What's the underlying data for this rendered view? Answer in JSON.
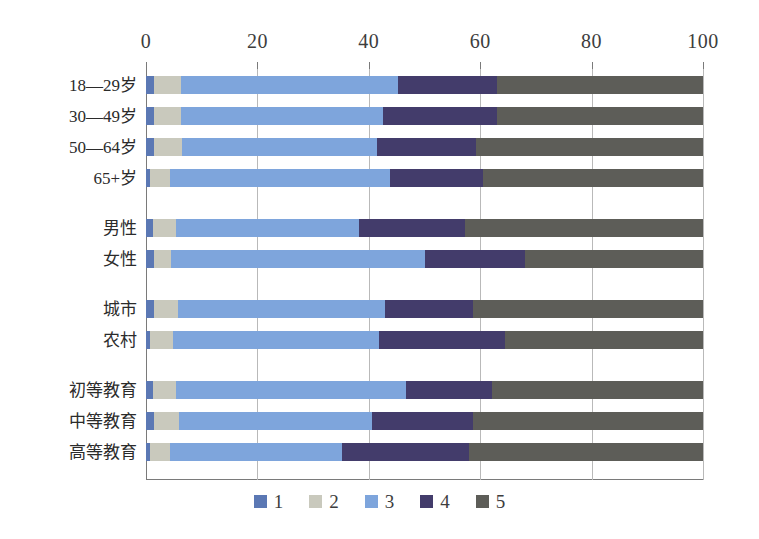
{
  "chart_data": {
    "type": "bar",
    "orientation": "horizontal",
    "stacked": true,
    "title": "",
    "xlabel": "",
    "ylabel": "",
    "xlim": [
      0,
      100
    ],
    "xticks": [
      0,
      20,
      40,
      60,
      80,
      100
    ],
    "xtick_labels": [
      "0",
      "20",
      "40",
      "60",
      "80",
      "100"
    ],
    "grid": true,
    "legend_position": "bottom",
    "legend": [
      "1",
      "2",
      "3",
      "4",
      "5"
    ],
    "colors": {
      "1": "#5b78b4",
      "2": "#c9c9bd",
      "3": "#7ea5dc",
      "4": "#433c6b",
      "5": "#5d5d58"
    },
    "categories": [
      "18—29岁",
      "30—49岁",
      "50—64岁",
      "65+岁",
      "男性",
      "女性",
      "城市",
      "农村",
      "初等教育",
      "中等教育",
      "高等教育"
    ],
    "category_groups": [
      {
        "name": "age",
        "categories": [
          "18—29岁",
          "30—49岁",
          "50—64岁",
          "65+岁"
        ]
      },
      {
        "name": "gender",
        "categories": [
          "男性",
          "女性"
        ]
      },
      {
        "name": "residence",
        "categories": [
          "城市",
          "农村"
        ]
      },
      {
        "name": "education",
        "categories": [
          "初等教育",
          "中等教育",
          "高等教育"
        ]
      }
    ],
    "series": [
      {
        "name": "1",
        "values": [
          1.5,
          1.5,
          1.5,
          0.8,
          1.2,
          1.5,
          1.5,
          0.8,
          1.2,
          1.5,
          0.8
        ]
      },
      {
        "name": "2",
        "values": [
          4.7,
          4.7,
          5.0,
          3.5,
          4.2,
          3.0,
          4.2,
          4.0,
          4.2,
          4.5,
          3.5
        ]
      },
      {
        "name": "3",
        "values": [
          39.0,
          36.3,
          35.0,
          39.5,
          32.8,
          45.6,
          37.3,
          37.0,
          41.3,
          34.5,
          30.9
        ]
      },
      {
        "name": "4",
        "values": [
          17.8,
          20.5,
          17.8,
          16.7,
          19.0,
          18.0,
          15.8,
          22.6,
          15.4,
          18.3,
          22.8
        ]
      },
      {
        "name": "5",
        "values": [
          37.0,
          37.0,
          40.7,
          39.5,
          42.8,
          31.9,
          41.2,
          35.6,
          37.9,
          41.2,
          42.0
        ]
      }
    ],
    "cumulative_boundaries": [
      [
        1.5,
        6.2,
        45.2,
        63.0,
        100
      ],
      [
        1.5,
        6.2,
        42.5,
        63.0,
        100
      ],
      [
        1.5,
        6.5,
        41.5,
        59.3,
        100
      ],
      [
        0.8,
        4.3,
        43.8,
        60.5,
        100
      ],
      [
        1.2,
        5.4,
        38.2,
        57.2,
        100
      ],
      [
        1.5,
        4.5,
        50.1,
        68.1,
        100
      ],
      [
        1.5,
        5.7,
        43.0,
        58.8,
        100
      ],
      [
        0.8,
        4.8,
        41.8,
        64.4,
        100
      ],
      [
        1.2,
        5.4,
        46.7,
        62.1,
        100
      ],
      [
        1.5,
        6.0,
        40.5,
        58.8,
        100
      ],
      [
        0.8,
        4.3,
        35.2,
        58.0,
        100
      ]
    ]
  },
  "layout": {
    "row_tops": [
      8,
      39,
      70,
      101,
      151,
      182,
      232,
      263,
      313,
      344,
      375
    ],
    "label_tops": [
      8,
      39,
      70,
      101,
      151,
      182,
      232,
      263,
      313,
      344,
      375
    ]
  }
}
